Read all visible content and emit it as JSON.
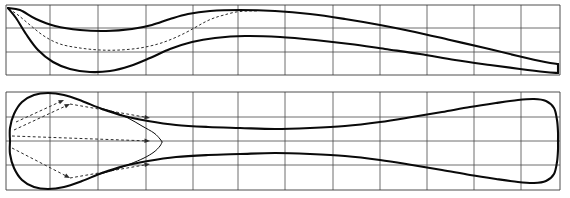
{
  "figure": {
    "title": "",
    "kind": "naval-architecture-lines-plan",
    "canvas": {
      "width": 570,
      "height": 198,
      "background": "#ffffff"
    },
    "stroke_colors": {
      "hull": "#0a0a0a",
      "grid": "#4a4a4a",
      "frame": "#3a3a3a",
      "dashed": "#2b2b2b"
    },
    "panels": [
      {
        "name": "profile-view",
        "label": "",
        "frame": {
          "x": 6,
          "y": 5,
          "width": 554,
          "height": 70
        },
        "grid": {
          "vertical_x": [
            6,
            50,
            98,
            146,
            193,
            238,
            285,
            333,
            380,
            427,
            474,
            521,
            560
          ],
          "horizontal_y": [
            5,
            28,
            52,
            75
          ],
          "stations": 12,
          "waterlines": 2
        },
        "curves": [
          {
            "name": "deck-sheer-line",
            "style": "heavy",
            "points": [
              [
                8,
                8
              ],
              [
                20,
                10
              ],
              [
                36,
                19
              ],
              [
                55,
                26
              ],
              [
                80,
                30
              ],
              [
                106,
                31
              ],
              [
                132,
                29
              ],
              [
                152,
                25
              ],
              [
                170,
                19
              ],
              [
                188,
                14
              ],
              [
                210,
                11
              ],
              [
                240,
                10
              ],
              [
                275,
                11
              ],
              [
                310,
                14
              ],
              [
                345,
                19
              ],
              [
                380,
                25
              ],
              [
                415,
                32
              ],
              [
                450,
                40
              ],
              [
                485,
                48
              ],
              [
                518,
                56
              ],
              [
                545,
                62
              ],
              [
                558,
                64
              ]
            ]
          },
          {
            "name": "keel-profile-line",
            "style": "heavy",
            "points": [
              [
                8,
                8
              ],
              [
                16,
                18
              ],
              [
                26,
                34
              ],
              [
                38,
                50
              ],
              [
                53,
                62
              ],
              [
                70,
                69
              ],
              [
                90,
                72
              ],
              [
                110,
                71
              ],
              [
                130,
                66
              ],
              [
                150,
                58
              ],
              [
                170,
                49
              ],
              [
                192,
                42
              ],
              [
                215,
                38
              ],
              [
                245,
                36
              ],
              [
                280,
                37
              ],
              [
                315,
                40
              ],
              [
                350,
                44
              ],
              [
                385,
                49
              ],
              [
                420,
                54
              ],
              [
                455,
                60
              ],
              [
                490,
                65
              ],
              [
                520,
                69
              ],
              [
                545,
                72
              ],
              [
                558,
                73
              ]
            ]
          },
          {
            "name": "transom-line",
            "style": "heavy",
            "points": [
              [
                558,
                64
              ],
              [
                558,
                73
              ]
            ]
          }
        ],
        "dashed_curves": [
          {
            "name": "buttock-line",
            "points": [
              [
                9,
                9
              ],
              [
                18,
                15
              ],
              [
                30,
                25
              ],
              [
                44,
                36
              ],
              [
                60,
                44
              ],
              [
                80,
                48
              ],
              [
                100,
                50
              ],
              [
                120,
                50
              ],
              [
                140,
                48
              ],
              [
                158,
                44
              ],
              [
                172,
                39
              ],
              [
                185,
                33
              ],
              [
                196,
                27
              ],
              [
                205,
                22
              ],
              [
                214,
                18
              ],
              [
                224,
                15
              ],
              [
                236,
                12
              ],
              [
                248,
                11
              ],
              [
                258,
                11
              ]
            ]
          }
        ]
      },
      {
        "name": "plan-view",
        "label": "",
        "frame": {
          "x": 6,
          "y": 92,
          "width": 554,
          "height": 98
        },
        "grid": {
          "vertical_x": [
            6,
            50,
            98,
            146,
            193,
            238,
            285,
            333,
            380,
            427,
            474,
            521,
            560
          ],
          "horizontal_y": [
            92,
            117,
            141,
            165,
            190
          ],
          "stations": 12,
          "centerline_y": 141
        },
        "curves": [
          {
            "name": "port-waterline",
            "style": "heavy",
            "points": [
              [
                10,
                141
              ],
              [
                10,
                128
              ],
              [
                14,
                114
              ],
              [
                22,
                102
              ],
              [
                34,
                95
              ],
              [
                48,
                93
              ],
              [
                64,
                95
              ],
              [
                82,
                101
              ],
              [
                102,
                109
              ],
              [
                124,
                116
              ],
              [
                148,
                121
              ],
              [
                176,
                125
              ],
              [
                208,
                127
              ],
              [
                240,
                128
              ],
              [
                275,
                129
              ],
              [
                310,
                128
              ],
              [
                345,
                126
              ],
              [
                380,
                122
              ],
              [
                412,
                117
              ],
              [
                442,
                112
              ],
              [
                470,
                107
              ],
              [
                496,
                103
              ],
              [
                518,
                100
              ],
              [
                534,
                99
              ],
              [
                546,
                101
              ],
              [
                554,
                108
              ],
              [
                557,
                120
              ],
              [
                558,
                132
              ],
              [
                558,
                141
              ]
            ]
          },
          {
            "name": "starboard-waterline",
            "style": "heavy",
            "points": [
              [
                10,
                141
              ],
              [
                10,
                154
              ],
              [
                14,
                168
              ],
              [
                22,
                180
              ],
              [
                34,
                187
              ],
              [
                48,
                189
              ],
              [
                64,
                187
              ],
              [
                82,
                181
              ],
              [
                102,
                173
              ],
              [
                124,
                166
              ],
              [
                148,
                161
              ],
              [
                176,
                157
              ],
              [
                208,
                155
              ],
              [
                240,
                154
              ],
              [
                275,
                153
              ],
              [
                310,
                154
              ],
              [
                345,
                156
              ],
              [
                380,
                160
              ],
              [
                412,
                165
              ],
              [
                442,
                170
              ],
              [
                470,
                175
              ],
              [
                496,
                179
              ],
              [
                518,
                182
              ],
              [
                534,
                183
              ],
              [
                546,
                181
              ],
              [
                554,
                174
              ],
              [
                557,
                162
              ],
              [
                558,
                150
              ],
              [
                558,
                141
              ]
            ]
          },
          {
            "name": "inner-nose-curve-upper",
            "style": "thin",
            "points": [
              [
                100,
                108
              ],
              [
                114,
                112
              ],
              [
                128,
                118
              ],
              [
                142,
                126
              ],
              [
                154,
                133
              ],
              [
                160,
                139
              ],
              [
                162,
                142
              ]
            ]
          },
          {
            "name": "inner-nose-curve-lower",
            "style": "thin",
            "points": [
              [
                162,
                142
              ],
              [
                160,
                146
              ],
              [
                154,
                152
              ],
              [
                144,
                158
              ],
              [
                130,
                164
              ],
              [
                114,
                170
              ],
              [
                100,
                174
              ]
            ]
          }
        ],
        "ray_arrows": [
          {
            "name": "ray-1",
            "from": [
              14,
              130
            ],
            "to": [
              70,
              104
            ]
          },
          {
            "name": "ray-2",
            "from": [
              70,
              104
            ],
            "to": [
              150,
              118
            ]
          },
          {
            "name": "ray-3",
            "from": [
              12,
              136
            ],
            "to": [
              150,
              141
            ]
          },
          {
            "name": "ray-4",
            "from": [
              12,
              148
            ],
            "to": [
              70,
              178
            ]
          },
          {
            "name": "ray-5",
            "from": [
              70,
              178
            ],
            "to": [
              150,
              164
            ]
          },
          {
            "name": "ray-6",
            "from": [
              16,
              122
            ],
            "to": [
              64,
              100
            ]
          }
        ]
      }
    ]
  }
}
